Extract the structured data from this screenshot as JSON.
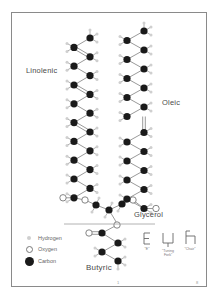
{
  "diagram": {
    "labels": {
      "linolenic": "Linolenic",
      "oleic": "Oleic",
      "glycerol": "Glycerol",
      "butyric": "Butyric"
    },
    "legend": [
      {
        "symbol": "hydrogen-dot",
        "label": "Hydrogen",
        "color": "#cfcfcf"
      },
      {
        "symbol": "oxygen-circle",
        "label": "Oxygen",
        "color": "#ffffff"
      },
      {
        "symbol": "carbon-dot",
        "label": "Carbon",
        "color": "#1a1a1a"
      }
    ],
    "shapes": [
      {
        "name": "E",
        "label": "\"E\""
      },
      {
        "name": "tuning-fork",
        "label": "\"Tuning Fork\""
      },
      {
        "name": "chair",
        "label": "\"Chair\""
      }
    ],
    "footer": {
      "center_mark": "1",
      "page_number": "8"
    },
    "colors": {
      "carbon": "#1a1a1a",
      "hydrogen": "#cfcfcf",
      "oxygen_stroke": "#777777",
      "bond": "#9a9a9a",
      "frame": "#8a8a8a"
    }
  }
}
